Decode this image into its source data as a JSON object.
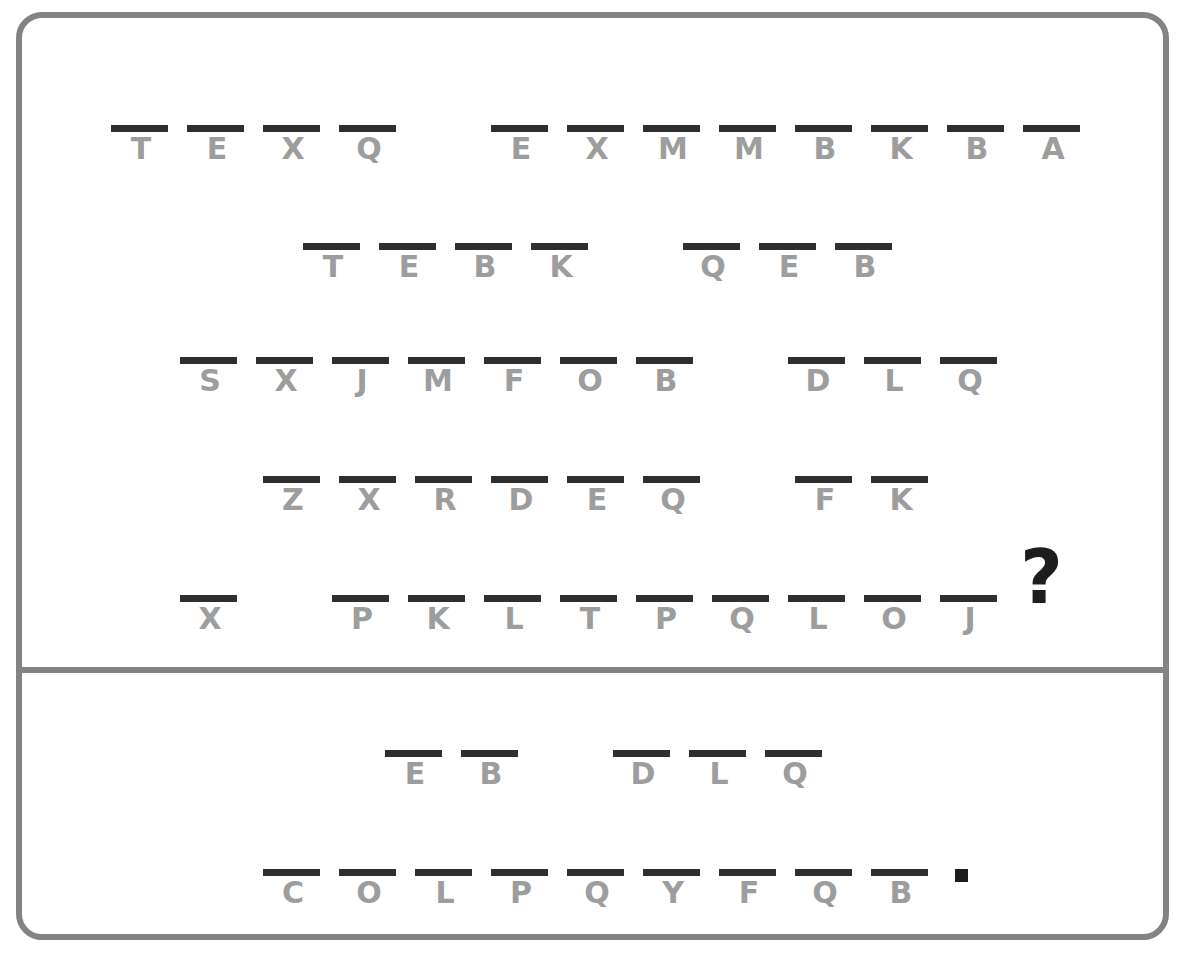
{
  "page": {
    "background": "#ffffff",
    "frame_color": "#838383",
    "dash_color": "#2f2f2f",
    "letter_color": "#9d9d9d",
    "punctuation_color": "#1d1d1d"
  },
  "clue_section": {
    "name": "cryptogram-quote",
    "rows": [
      {
        "id": "row-1",
        "top": 125,
        "left": 103,
        "words": [
          {
            "letters": [
              "T",
              "E",
              "X",
              "Q"
            ],
            "gap_after": 76
          },
          {
            "letters": [
              "E",
              "X",
              "M",
              "M",
              "B",
              "K",
              "B",
              "A"
            ],
            "gap_after": 0
          }
        ]
      },
      {
        "id": "row-2",
        "top": 243,
        "left": 295,
        "words": [
          {
            "letters": [
              "T",
              "E",
              "B",
              "K"
            ],
            "gap_after": 76
          },
          {
            "letters": [
              "Q",
              "E",
              "B"
            ],
            "gap_after": 0
          }
        ]
      },
      {
        "id": "row-3",
        "top": 357,
        "left": 172,
        "words": [
          {
            "letters": [
              "S",
              "X",
              "J",
              "M",
              "F",
              "O",
              "B"
            ],
            "gap_after": 76
          },
          {
            "letters": [
              "D",
              "L",
              "Q"
            ],
            "gap_after": 0
          }
        ]
      },
      {
        "id": "row-4",
        "top": 476,
        "left": 255,
        "words": [
          {
            "letters": [
              "Z",
              "X",
              "R",
              "D",
              "E",
              "Q"
            ],
            "gap_after": 76
          },
          {
            "letters": [
              "F",
              "K"
            ],
            "gap_after": 0
          }
        ]
      },
      {
        "id": "row-5",
        "top": 595,
        "left": 172,
        "words": [
          {
            "letters": [
              "X"
            ],
            "gap_after": 76
          },
          {
            "letters": [
              "P",
              "K",
              "L",
              "T",
              "P",
              "Q",
              "L",
              "O",
              "J"
            ],
            "gap_after": 0
          }
        ]
      }
    ],
    "punctuation": {
      "question_mark": "?"
    }
  },
  "answer_section": {
    "name": "cryptogram-answer",
    "rows": [
      {
        "id": "row-6",
        "top": 750,
        "left": 377,
        "words": [
          {
            "letters": [
              "E",
              "B"
            ],
            "gap_after": 76
          },
          {
            "letters": [
              "D",
              "L",
              "Q"
            ],
            "gap_after": 0
          }
        ]
      },
      {
        "id": "row-7",
        "top": 869,
        "left": 255,
        "words": [
          {
            "letters": [
              "C",
              "O",
              "L",
              "P",
              "Q",
              "Y",
              "F",
              "Q",
              "B"
            ],
            "gap_after": 0
          }
        ]
      }
    ],
    "punctuation": {
      "period": "."
    }
  }
}
